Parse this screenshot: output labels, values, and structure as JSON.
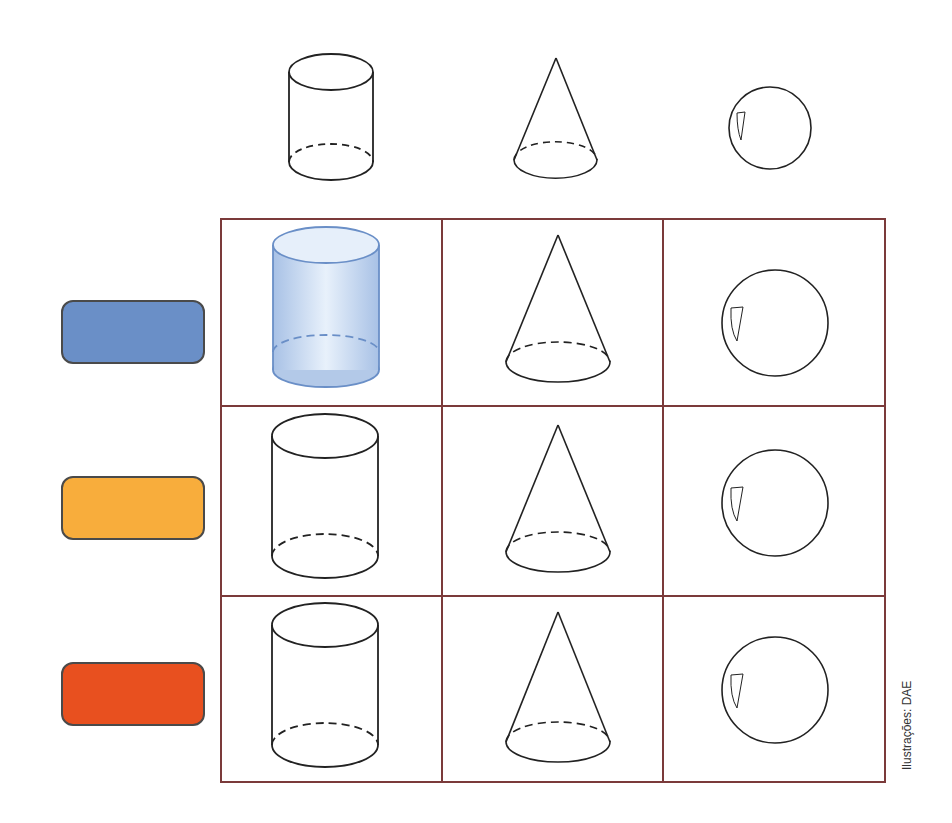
{
  "header_shapes": [
    {
      "shape": "cylinder",
      "label": "cylinder"
    },
    {
      "shape": "cone",
      "label": "cone"
    },
    {
      "shape": "sphere",
      "label": "sphere"
    }
  ],
  "color_swatches": [
    {
      "name": "blue",
      "color": "#6a8fc7"
    },
    {
      "name": "yellow",
      "color": "#f8ad3c"
    },
    {
      "name": "red",
      "color": "#e8501f"
    }
  ],
  "grid": {
    "rows": 3,
    "columns": [
      "cylinder",
      "cone",
      "sphere"
    ],
    "border_color": "#7b3a3a",
    "filled_cells": [
      {
        "row": 0,
        "col": 0,
        "fill": "#bcd3ee",
        "stroke": "#6a8fc7"
      }
    ]
  },
  "credit": "Ilustrações: DAE"
}
